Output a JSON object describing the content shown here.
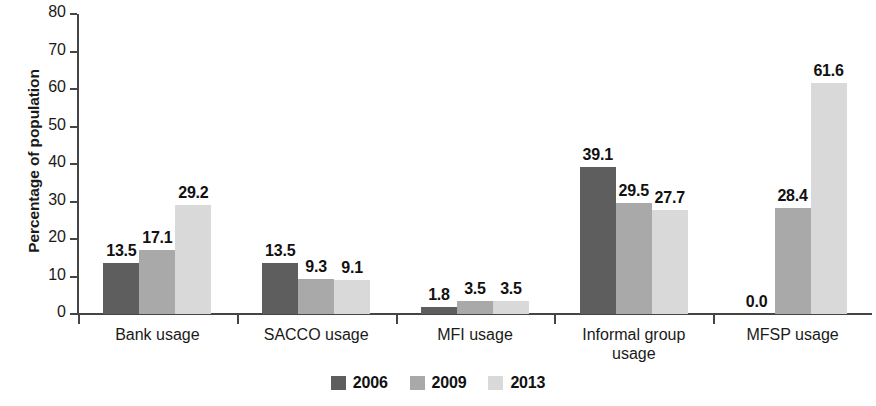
{
  "chart_data": {
    "type": "bar",
    "title": "",
    "subtitle": "",
    "xlabel": "",
    "ylabel": "Percentage of population",
    "ylim": [
      0,
      80
    ],
    "ytick_step": 10,
    "ytick_labels": [
      "0",
      "10",
      "20",
      "30",
      "40",
      "50",
      "60",
      "70",
      "80"
    ],
    "grid": false,
    "legend_position": "bottom",
    "categories": [
      "Bank usage",
      "SACCO usage",
      "MFI usage",
      "Informal group usage",
      "MFSP usage"
    ],
    "category_lines": [
      [
        "Bank usage"
      ],
      [
        "SACCO usage"
      ],
      [
        "MFI usage"
      ],
      [
        "Informal group",
        "usage"
      ],
      [
        "MFSP usage"
      ]
    ],
    "series": [
      {
        "name": "2006",
        "color": "#5e5e5e",
        "values": [
          13.5,
          13.5,
          1.8,
          39.1,
          0.0
        ],
        "labels": [
          "13.5",
          "13.5",
          "1.8",
          "39.1",
          "0.0"
        ]
      },
      {
        "name": "2009",
        "color": "#a9a9a9",
        "values": [
          17.1,
          9.3,
          3.5,
          29.5,
          28.4
        ],
        "labels": [
          "17.1",
          "9.3",
          "3.5",
          "29.5",
          "28.4"
        ]
      },
      {
        "name": "2013",
        "color": "#d9d9d9",
        "values": [
          29.2,
          9.1,
          3.5,
          27.7,
          61.6
        ],
        "labels": [
          "29.2",
          "9.1",
          "3.5",
          "27.7",
          "61.6"
        ]
      }
    ]
  },
  "axis": {
    "y_title": "Percentage of population",
    "axis_color": "#454545"
  },
  "legend": {
    "entries": [
      {
        "label": "2006",
        "color": "#5e5e5e"
      },
      {
        "label": "2009",
        "color": "#a9a9a9"
      },
      {
        "label": "2013",
        "color": "#d9d9d9"
      }
    ]
  }
}
